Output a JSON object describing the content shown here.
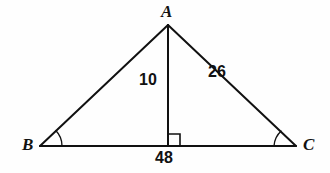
{
  "diagram": {
    "type": "triangle-with-altitude",
    "vertices": [
      {
        "name": "A",
        "label": "A",
        "x": 168,
        "y": 25,
        "role": "apex"
      },
      {
        "name": "B",
        "label": "B",
        "x": 40,
        "y": 146,
        "role": "base-left"
      },
      {
        "name": "C",
        "label": "C",
        "x": 296,
        "y": 146,
        "role": "base-right"
      }
    ],
    "altitude": {
      "from": "A",
      "foot_x": 168,
      "foot_y": 146,
      "label": "10"
    },
    "segments": [
      {
        "name": "side-AB",
        "from": "A",
        "to": "B",
        "label": ""
      },
      {
        "name": "side-AC",
        "from": "A",
        "to": "C",
        "label": "26"
      },
      {
        "name": "base-BC",
        "from": "B",
        "to": "C",
        "label": "48"
      }
    ],
    "labels": {
      "vertex_a": "A",
      "vertex_b": "B",
      "vertex_c": "C",
      "altitude": "10",
      "hypotenuse": "26",
      "base": "48"
    },
    "angle_marks": [
      {
        "name": "angle-B",
        "at": "B",
        "style": "arc"
      },
      {
        "name": "angle-C",
        "at": "C",
        "style": "arc"
      },
      {
        "name": "angle-right",
        "at": "altitude-foot",
        "style": "square"
      }
    ],
    "colors": {
      "stroke": "#111111",
      "background": "#fefefe",
      "text": "#111111"
    }
  }
}
